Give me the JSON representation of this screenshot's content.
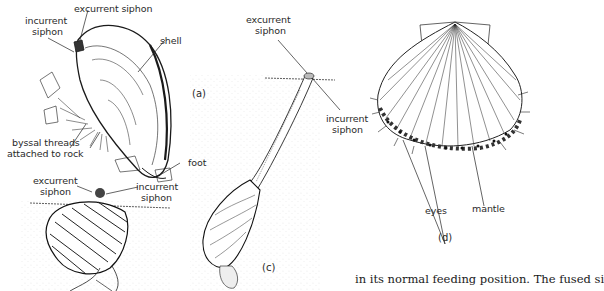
{
  "figure": {
    "panels": [
      {
        "id": "a",
        "tag": "(a)",
        "subject": "mussel",
        "labels": {
          "excurrent": "excurrent siphon",
          "incurrent_1": "incurrent",
          "incurrent_2": "siphon",
          "shell": "shell",
          "byssal_1": "byssal threads",
          "byssal_2": "attached to rock",
          "foot": "foot"
        }
      },
      {
        "id": "b",
        "subject": "cockle",
        "labels": {
          "excurrent_1": "excurrent",
          "excurrent_2": "siphon",
          "incurrent_1": "incurrent",
          "incurrent_2": "siphon"
        }
      },
      {
        "id": "c",
        "tag": "(c)",
        "subject": "razor clam / geoduck with long siphon",
        "labels": {
          "excurrent_1": "excurrent",
          "excurrent_2": "siphon",
          "incurrent_1": "incurrent",
          "incurrent_2": "siphon"
        }
      },
      {
        "id": "d",
        "tag": "(d)",
        "subject": "scallop",
        "labels": {
          "eyes": "eyes",
          "mantle": "mantle"
        }
      }
    ],
    "caption_fragment": "in its normal feeding position. The fused si"
  }
}
